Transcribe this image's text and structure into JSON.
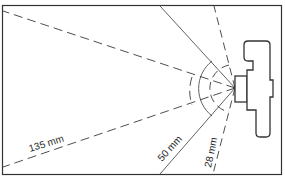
{
  "diagram": {
    "colors": {
      "line": "#3a3a3a",
      "frame": "#333333",
      "background": "#ffffff"
    },
    "lenses": [
      {
        "focal_length": 28,
        "label": "28 mm",
        "style": "dashed"
      },
      {
        "focal_length": 50,
        "label": "50 mm",
        "style": "solid"
      },
      {
        "focal_length": 135,
        "label": "135 mm",
        "style": "dashed"
      }
    ],
    "camera": {
      "icon": "camera-top-view-icon"
    }
  }
}
